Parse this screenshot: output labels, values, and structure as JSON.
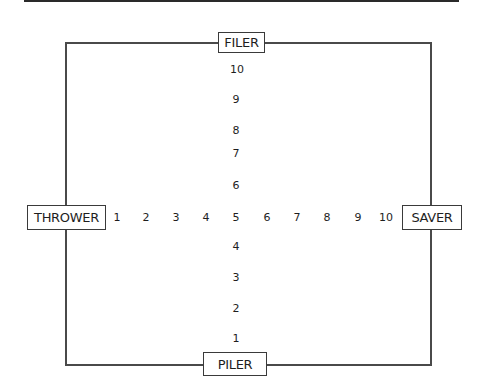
{
  "diagram": {
    "axes": {
      "top_label": "FILER",
      "bottom_label": "PILER",
      "left_label": "THROWER",
      "right_label": "SAVER"
    },
    "horizontal_scale": [
      "1",
      "2",
      "3",
      "4",
      "5",
      "6",
      "7",
      "8",
      "9",
      "10"
    ],
    "vertical_scale": [
      "10",
      "9",
      "8",
      "7",
      "6",
      "4",
      "3",
      "2",
      "1"
    ]
  }
}
